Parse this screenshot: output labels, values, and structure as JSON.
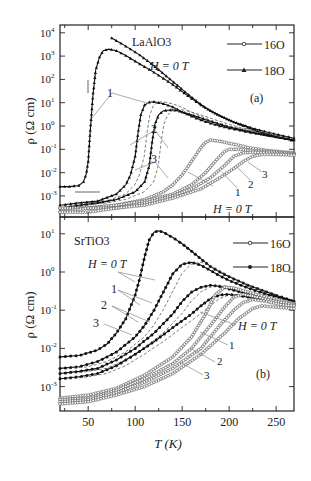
{
  "figure": {
    "xlabel": "T (K)",
    "ylabel": "ρ (Ω cm)",
    "xlim": [
      20,
      269
    ],
    "xticks": [
      50,
      100,
      150,
      200,
      250
    ]
  },
  "chart_data": [
    {
      "type": "line",
      "panel": "(a)",
      "title": "LaAlO3",
      "field_label": "H = 0 T",
      "xlabel": "T (K)",
      "ylabel": "ρ (Ω cm)",
      "yscale": "log",
      "ylim": [
        0.0002,
        20000
      ],
      "yticks": [
        "10^4",
        "10^3",
        "10^2",
        "10^1",
        "10^0",
        "10^-1",
        "10^-2",
        "10^-3"
      ],
      "legend": [
        {
          "label": "16O",
          "marker": "open-circle"
        },
        {
          "label": "18O",
          "marker": "filled-triangle"
        }
      ],
      "curve_labels": [
        "H = 0 T",
        "1",
        "2",
        "3"
      ],
      "series": [
        {
          "name": "18O H=0 T",
          "isotope": "18O",
          "field": "0 T",
          "style": "solid",
          "x": [
            20,
            30,
            40,
            45,
            48,
            50,
            52,
            55,
            58,
            62,
            66,
            72,
            80,
            90,
            100,
            110,
            120,
            130,
            140,
            150,
            160,
            170,
            180,
            190,
            200,
            210,
            220,
            230,
            240,
            250,
            260,
            269
          ],
          "y": [
            0.0025,
            0.0025,
            0.0028,
            0.004,
            0.009,
            0.03,
            0.5,
            20,
            250,
            900,
            1700,
            2000,
            1700,
            1050,
            600,
            350,
            200,
            110,
            60,
            30,
            15,
            8,
            4.5,
            2.8,
            1.8,
            1.2,
            0.85,
            0.6,
            0.45,
            0.35,
            0.28,
            0.23
          ]
        },
        {
          "name": "18O (upper branch)",
          "isotope": "18O",
          "field": "0 T",
          "style": "solid",
          "x": [
            75,
            85,
            95,
            105,
            115,
            125,
            135,
            145,
            155,
            165,
            175,
            185,
            195,
            205,
            215,
            225,
            240,
            255,
            269
          ],
          "y": [
            6000,
            3500,
            2000,
            1100,
            550,
            260,
            120,
            55,
            25,
            12,
            6,
            3.5,
            2.2,
            1.5,
            1.1,
            0.8,
            0.55,
            0.4,
            0.3
          ]
        },
        {
          "name": "18O H=1 T",
          "isotope": "18O",
          "field": "1 T",
          "style": "solid",
          "x": [
            20,
            40,
            60,
            80,
            90,
            95,
            100,
            103,
            106,
            110,
            115,
            120,
            130,
            140,
            150,
            160,
            170,
            180,
            190,
            200,
            220,
            240,
            269
          ],
          "y": [
            0.0004,
            0.0005,
            0.0006,
            0.0012,
            0.003,
            0.008,
            0.05,
            0.5,
            3,
            8,
            10.5,
            11,
            9,
            6.5,
            4,
            2.6,
            1.8,
            1.3,
            1,
            0.8,
            0.55,
            0.4,
            0.25
          ]
        },
        {
          "name": "18O H=2 T",
          "isotope": "18O",
          "field": "2 T",
          "style": "solid",
          "x": [
            20,
            40,
            60,
            80,
            100,
            110,
            115,
            118,
            121,
            125,
            130,
            140,
            150,
            160,
            170,
            180,
            200,
            220,
            240,
            269
          ],
          "y": [
            0.0003,
            0.0004,
            0.0005,
            0.0007,
            0.0015,
            0.004,
            0.02,
            0.2,
            1.2,
            3,
            4.5,
            5,
            4,
            3,
            2.2,
            1.6,
            0.9,
            0.6,
            0.4,
            0.25
          ]
        },
        {
          "name": "16O H=0 T",
          "isotope": "16O",
          "field": "0 T",
          "style": "open-circle",
          "x": [
            20,
            50,
            80,
            110,
            130,
            140,
            150,
            160,
            170,
            175,
            180,
            190,
            200,
            210,
            220,
            240,
            269
          ],
          "y": [
            0.0003,
            0.0003,
            0.0004,
            0.0007,
            0.0015,
            0.003,
            0.008,
            0.03,
            0.12,
            0.2,
            0.25,
            0.22,
            0.18,
            0.15,
            0.12,
            0.09,
            0.07
          ]
        },
        {
          "name": "16O H=1 T",
          "isotope": "16O",
          "field": "1 T",
          "style": "open-circle",
          "x": [
            20,
            50,
            80,
            110,
            140,
            160,
            175,
            185,
            195,
            200,
            210,
            220,
            240,
            269
          ],
          "y": [
            0.0003,
            0.0003,
            0.0004,
            0.0006,
            0.0012,
            0.003,
            0.01,
            0.03,
            0.08,
            0.1,
            0.1,
            0.09,
            0.08,
            0.065
          ]
        },
        {
          "name": "16O H=2 T",
          "isotope": "16O",
          "field": "2 T",
          "style": "open-circle",
          "x": [
            20,
            50,
            80,
            110,
            140,
            160,
            180,
            195,
            205,
            215,
            225,
            240,
            269
          ],
          "y": [
            0.0002,
            0.0003,
            0.0003,
            0.0005,
            0.001,
            0.002,
            0.006,
            0.02,
            0.05,
            0.07,
            0.075,
            0.07,
            0.06
          ]
        },
        {
          "name": "16O H=3 T",
          "isotope": "16O",
          "field": "3 T",
          "style": "open-circle",
          "x": [
            20,
            50,
            80,
            110,
            140,
            170,
            190,
            205,
            215,
            225,
            235,
            250,
            269
          ],
          "y": [
            0.0002,
            0.0002,
            0.0003,
            0.0004,
            0.0008,
            0.002,
            0.006,
            0.015,
            0.03,
            0.05,
            0.06,
            0.06,
            0.055
          ]
        }
      ]
    },
    {
      "type": "line",
      "panel": "(b)",
      "title": "SrTiO3",
      "field_label": "H = 0 T",
      "xlabel": "T (K)",
      "ylabel": "ρ (Ω cm)",
      "yscale": "log",
      "ylim": [
        0.0002,
        30
      ],
      "yticks": [
        "10^1",
        "10^0",
        "10^-1",
        "10^-2",
        "10^-3"
      ],
      "legend": [
        {
          "label": "16O",
          "marker": "open-circle"
        },
        {
          "label": "18O",
          "marker": "filled-circle"
        }
      ],
      "curve_labels": [
        "H = 0 T",
        "1",
        "2",
        "3"
      ],
      "series": [
        {
          "name": "18O H=0 T",
          "isotope": "18O",
          "field": "0 T",
          "style": "filled",
          "x": [
            20,
            40,
            60,
            70,
            80,
            90,
            100,
            105,
            110,
            115,
            120,
            125,
            130,
            140,
            150,
            160,
            170,
            180,
            190,
            200,
            220,
            240,
            269
          ],
          "y": [
            0.006,
            0.0065,
            0.009,
            0.013,
            0.025,
            0.06,
            0.25,
            0.7,
            2.5,
            7,
            11,
            12,
            11,
            8,
            5.5,
            3.5,
            2.2,
            1.4,
            1,
            0.75,
            0.45,
            0.3,
            0.17
          ]
        },
        {
          "name": "18O H=1 T",
          "isotope": "18O",
          "field": "1 T",
          "style": "filled",
          "x": [
            20,
            40,
            60,
            80,
            100,
            110,
            120,
            130,
            140,
            150,
            160,
            170,
            180,
            190,
            200,
            220,
            240,
            269
          ],
          "y": [
            0.003,
            0.0033,
            0.0045,
            0.008,
            0.02,
            0.04,
            0.1,
            0.3,
            0.9,
            1.6,
            1.8,
            1.5,
            1.1,
            0.8,
            0.6,
            0.38,
            0.26,
            0.17
          ]
        },
        {
          "name": "18O H=2 T",
          "isotope": "18O",
          "field": "2 T",
          "style": "filled",
          "x": [
            20,
            40,
            60,
            80,
            100,
            120,
            140,
            150,
            160,
            170,
            180,
            190,
            200,
            220,
            240,
            269
          ],
          "y": [
            0.0022,
            0.0025,
            0.003,
            0.005,
            0.01,
            0.025,
            0.08,
            0.17,
            0.3,
            0.4,
            0.45,
            0.42,
            0.36,
            0.26,
            0.2,
            0.15
          ]
        },
        {
          "name": "18O H=3 T",
          "isotope": "18O",
          "field": "3 T",
          "style": "filled",
          "x": [
            20,
            40,
            60,
            80,
            100,
            120,
            140,
            160,
            170,
            180,
            190,
            200,
            220,
            240,
            269
          ],
          "y": [
            0.0016,
            0.0018,
            0.0022,
            0.0035,
            0.007,
            0.015,
            0.035,
            0.08,
            0.13,
            0.2,
            0.25,
            0.26,
            0.22,
            0.17,
            0.13
          ]
        },
        {
          "name": "16O H=0 T",
          "isotope": "16O",
          "field": "0 T",
          "style": "open-circle",
          "x": [
            20,
            50,
            80,
            110,
            140,
            160,
            175,
            185,
            195,
            205,
            220,
            240,
            269
          ],
          "y": [
            0.0005,
            0.0006,
            0.0009,
            0.002,
            0.006,
            0.02,
            0.08,
            0.25,
            0.4,
            0.38,
            0.3,
            0.22,
            0.15
          ]
        },
        {
          "name": "16O H=1 T",
          "isotope": "16O",
          "field": "1 T",
          "style": "open-circle",
          "x": [
            20,
            50,
            80,
            110,
            140,
            160,
            180,
            195,
            205,
            215,
            230,
            250,
            269
          ],
          "y": [
            0.00045,
            0.0005,
            0.0008,
            0.0016,
            0.004,
            0.01,
            0.04,
            0.12,
            0.22,
            0.26,
            0.22,
            0.17,
            0.14
          ]
        },
        {
          "name": "16O H=2 T",
          "isotope": "16O",
          "field": "2 T",
          "style": "open-circle",
          "x": [
            20,
            50,
            80,
            110,
            140,
            170,
            190,
            205,
            215,
            225,
            240,
            255,
            269
          ],
          "y": [
            0.0004,
            0.00045,
            0.0007,
            0.0013,
            0.003,
            0.01,
            0.04,
            0.1,
            0.16,
            0.19,
            0.17,
            0.14,
            0.13
          ]
        },
        {
          "name": "16O H=3 T",
          "isotope": "16O",
          "field": "3 T",
          "style": "open-circle",
          "x": [
            20,
            50,
            80,
            110,
            140,
            170,
            195,
            210,
            225,
            235,
            250,
            269
          ],
          "y": [
            0.00035,
            0.0004,
            0.0006,
            0.001,
            0.0022,
            0.007,
            0.025,
            0.06,
            0.11,
            0.13,
            0.12,
            0.11
          ]
        }
      ]
    }
  ]
}
